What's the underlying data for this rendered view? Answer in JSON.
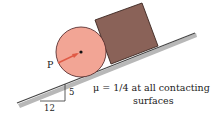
{
  "diagram": {
    "labels": {
      "force": "P",
      "rise": "5",
      "run": "12",
      "friction_line1": "μ = 1/4 at all contacting",
      "friction_line2": "surfaces"
    },
    "colors": {
      "cylinder_fill": "#f2a595",
      "cylinder_stroke": "#5a3030",
      "block_fill": "#8a6258",
      "block_stroke": "#3b2620",
      "incline": "#555555",
      "incline_shadow": "#b5b5b5",
      "arrow": "#e05a45",
      "text": "#222222"
    }
  }
}
